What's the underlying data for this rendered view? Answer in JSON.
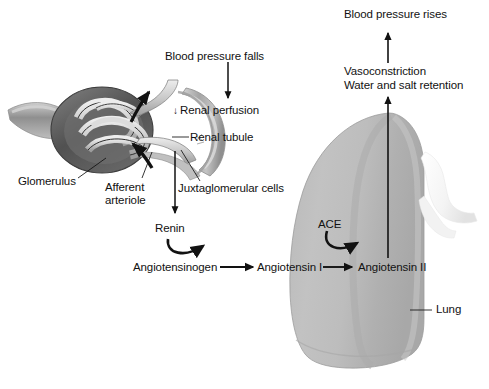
{
  "diagram": {
    "domain": "medical-physiology-flow-diagram",
    "canvas": {
      "width": 489,
      "height": 389,
      "background": "#ffffff"
    },
    "colors": {
      "ink": "#121212",
      "lung_fill": "#b4b4b4",
      "lung_fill_light": "#c9c9c9",
      "lung_fill_dark": "#a2a2a2",
      "lung_edge": "#8d8d8d",
      "capsule_dark": "#4a4a4a",
      "capsule_mid": "#6f6f6f",
      "capillary_light": "#d8d8d8",
      "vessel_mid": "#9a9a9a",
      "tubule_light": "#cfcfcf",
      "tubule_mid": "#a8a8a8"
    },
    "labels": {
      "blood_pressure_falls": "Blood pressure falls",
      "renal_perfusion": "Renal perfusion",
      "renal_perfusion_arrow": "↓",
      "renal_tubule": "Renal tubule",
      "glomerulus": "Glomerulus",
      "afferent_arteriole_line1": "Afferent",
      "afferent_arteriole_line2": "arteriole",
      "juxtaglomerular_cells": "Juxtaglomerular cells",
      "renin": "Renin",
      "angiotensinogen": "Angiotensinogen",
      "angiotensin_i": "Angiotensin I",
      "angiotensin_ii": "Angiotensin II",
      "ace": "ACE",
      "lung": "Lung",
      "vasoconstriction": "Vasoconstriction",
      "water_and_salt_retention": "Water and salt retention",
      "blood_pressure_rises": "Blood pressure rises"
    },
    "flow_steps": [
      "Blood pressure falls",
      "↓ Renal perfusion",
      "Renin",
      "Angiotensinogen",
      "Angiotensin I",
      "Angiotensin II",
      "Vasoconstriction / Water and salt retention",
      "Blood pressure rises"
    ],
    "anatomy_parts": [
      "Glomerulus",
      "Afferent arteriole",
      "Renal tubule",
      "Juxtaglomerular cells",
      "Lung"
    ],
    "enzymes": [
      "Renin",
      "ACE"
    ]
  }
}
